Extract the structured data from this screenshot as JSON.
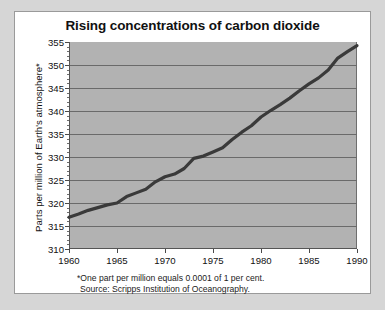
{
  "figure": {
    "title": "Rising concentrations of carbon dioxide",
    "y_axis_title": "Parts per million of Earth's atmosphere*",
    "footnote": "*One part per million equals 0.0001 of 1 per cent.",
    "source": "Source: Scripps Institution of Oceanography.",
    "colors": {
      "page_background": "#d6d6d6",
      "card_background": "#ffffff",
      "plot_background": "#b2b2b2",
      "gridline": "#6a6a6a",
      "data_line": "#3a3a3a",
      "text": "#111111"
    }
  },
  "chart_data": {
    "type": "line",
    "title": "Rising concentrations of carbon dioxide",
    "xlabel": "",
    "ylabel": "Parts per million of Earth's atmosphere*",
    "xlim": [
      1960,
      1990
    ],
    "ylim": [
      310,
      355
    ],
    "grid": true,
    "legend": "none",
    "x_ticks": [
      1960,
      1965,
      1970,
      1975,
      1980,
      1985,
      1990
    ],
    "y_ticks": [
      310,
      315,
      320,
      325,
      330,
      335,
      340,
      345,
      350,
      355
    ],
    "y_minor_tick_step": 1,
    "series": [
      {
        "name": "Atmospheric CO2 concentration (Mauna Loa)",
        "x": [
          1960,
          1961,
          1962,
          1963,
          1964,
          1965,
          1966,
          1967,
          1968,
          1969,
          1970,
          1971,
          1972,
          1973,
          1974,
          1975,
          1976,
          1977,
          1978,
          1979,
          1980,
          1981,
          1982,
          1983,
          1984,
          1985,
          1986,
          1987,
          1988,
          1989,
          1990
        ],
        "values": [
          316.9,
          317.6,
          318.4,
          319.0,
          319.6,
          320.0,
          321.4,
          322.2,
          323.0,
          324.6,
          325.7,
          326.3,
          327.5,
          329.7,
          330.2,
          331.1,
          332.0,
          333.8,
          335.4,
          336.8,
          338.7,
          340.1,
          341.4,
          342.8,
          344.4,
          345.9,
          347.2,
          348.9,
          351.5,
          352.9,
          354.2
        ]
      }
    ]
  }
}
